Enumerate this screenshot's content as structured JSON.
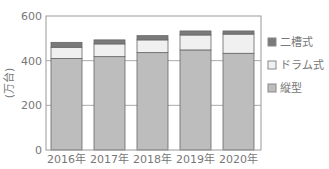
{
  "chart_data": {
    "type": "bar",
    "stacked": true,
    "title": "",
    "xlabel": "",
    "ylabel": "(万台)",
    "ylim": [
      0,
      600
    ],
    "yticks": [
      0,
      200,
      400,
      600
    ],
    "grid": true,
    "legend_position": "right",
    "categories": [
      "2016年",
      "2017年",
      "2018年",
      "2019年",
      "2020年"
    ],
    "series": [
      {
        "name": "縦型",
        "color": "#bdbdbd",
        "values": [
          410,
          418,
          436,
          448,
          433
        ]
      },
      {
        "name": "ドラム式",
        "color": "#f0f0f0",
        "values": [
          50,
          57,
          57,
          67,
          86
        ]
      },
      {
        "name": "二槽式",
        "color": "#7a7a7a",
        "values": [
          22,
          18,
          19,
          18,
          14
        ]
      }
    ],
    "legend": [
      "二槽式",
      "ドラム式",
      "縦型"
    ]
  }
}
